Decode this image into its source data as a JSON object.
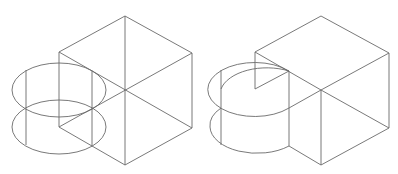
{
  "figure": {
    "panels": [
      {
        "id": "left",
        "description": "Wireframe: cube with intersecting cylinder, all edges visible"
      },
      {
        "id": "right",
        "description": "Hidden-line: cube with cylinder, occluded edges removed"
      }
    ],
    "line_color": "#6a6a6a",
    "background": "#ffffff"
  }
}
